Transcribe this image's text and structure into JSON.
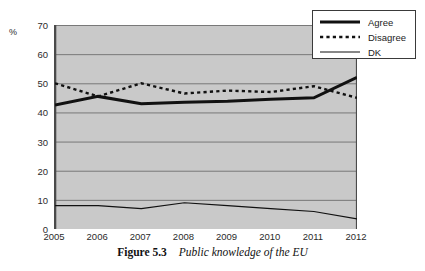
{
  "axis": {
    "unit_label": "%",
    "yticks": [
      0,
      10,
      20,
      30,
      40,
      50,
      60,
      70
    ],
    "xticks": [
      "2005",
      "2006",
      "2007",
      "2008",
      "2009",
      "2010",
      "2011",
      "2012"
    ]
  },
  "legend": {
    "items": [
      {
        "label": "Agree",
        "style": "thick-solid"
      },
      {
        "label": "Disagree",
        "style": "dotted"
      },
      {
        "label": "DK",
        "style": "thin-solid"
      }
    ]
  },
  "caption": {
    "label": "Figure 5.3",
    "title": "Public knowledge of the EU"
  },
  "colors": {
    "plot_background": "#c9c9c9",
    "gridline": "#6e6e6e",
    "axis": "#4a4a4a",
    "series": "#111111",
    "page_background": "#ffffff"
  },
  "chart_data": {
    "type": "line",
    "title": "Public knowledge of the EU",
    "xlabel": "",
    "ylabel": "%",
    "ylim": [
      0,
      70
    ],
    "grid": true,
    "legend_position": "top-right",
    "categories": [
      "2005",
      "2006",
      "2007",
      "2008",
      "2009",
      "2010",
      "2011",
      "2012"
    ],
    "series": [
      {
        "name": "Agree",
        "values": [
          42.5,
          45.5,
          43.0,
          43.5,
          43.8,
          44.5,
          45.0,
          52.0
        ]
      },
      {
        "name": "Disagree",
        "values": [
          50.0,
          45.5,
          50.0,
          46.5,
          47.5,
          47.0,
          49.0,
          45.0
        ]
      },
      {
        "name": "DK",
        "values": [
          8.0,
          8.0,
          7.0,
          9.0,
          8.0,
          7.0,
          6.0,
          3.5
        ]
      }
    ]
  }
}
